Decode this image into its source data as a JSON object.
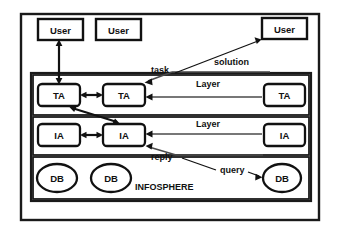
{
  "diagram": {
    "title_label": "INFOSPHERE",
    "users": [
      {
        "id": "user-1",
        "label": "User"
      },
      {
        "id": "user-2",
        "label": "User"
      },
      {
        "id": "user-3",
        "label": "User"
      }
    ],
    "task_layer": {
      "layer_label": "Layer",
      "agents": [
        {
          "id": "ta-1",
          "label": "TA"
        },
        {
          "id": "ta-2",
          "label": "TA"
        },
        {
          "id": "ta-3",
          "label": "TA"
        }
      ]
    },
    "info_layer": {
      "layer_label": "Layer",
      "agents": [
        {
          "id": "ia-1",
          "label": "IA"
        },
        {
          "id": "ia-2",
          "label": "IA"
        },
        {
          "id": "ia-3",
          "label": "IA"
        }
      ]
    },
    "database_layer": {
      "databases": [
        {
          "id": "db-1",
          "label": "DB"
        },
        {
          "id": "db-2",
          "label": "DB"
        },
        {
          "id": "db-3",
          "label": "DB"
        }
      ]
    },
    "edge_labels": {
      "task": "task",
      "solution": "solution",
      "reply": "reply",
      "query": "query"
    },
    "colors": {
      "stroke": "#111111",
      "thin_stroke": "#4a4a4a",
      "background": "#ffffff"
    }
  }
}
